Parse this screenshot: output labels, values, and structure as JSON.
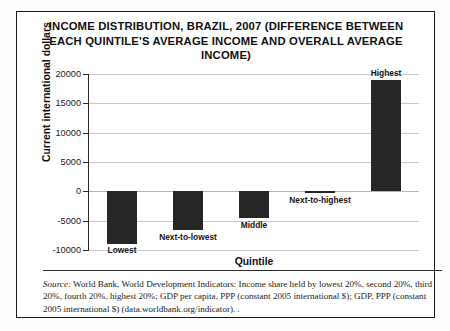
{
  "figure": {
    "title": "INCOME DISTRIBUTION, BRAZIL, 2007 (DIFFERENCE BETWEEN EACH QUINTILE'S AVERAGE INCOME AND OVERALL AVERAGE INCOME)",
    "source_prefix": "Source:",
    "source_text": " World Bank, World Development Indicators: Income share held by lowest 20%, second 20%, third 20%, fourth 20%, highest 20%; GDP per capita, PPP (constant 2005 international $); GDP, PPP (constant 2005 international $) (data.worldbank.org/indicator). ."
  },
  "colors": {
    "bar": "#262626",
    "grid": "#c9c9c9",
    "axis": "#2a2a2a",
    "text": "#111111",
    "background": "#ffffff"
  },
  "chart_data": {
    "type": "bar",
    "title": "INCOME DISTRIBUTION, BRAZIL, 2007 (DIFFERENCE BETWEEN EACH QUINTILE'S AVERAGE INCOME AND OVERALL AVERAGE INCOME)",
    "xlabel": "Quintile",
    "ylabel": "Current international dollars",
    "categories": [
      "Lowest",
      "Next-to-lowest",
      "Middle",
      "Next-to-highest",
      "Highest"
    ],
    "values": [
      -8900,
      -6600,
      -4600,
      -200,
      18900
    ],
    "ylim": [
      -10000,
      20000
    ],
    "yticks": [
      20000,
      15000,
      10000,
      5000,
      0,
      -5000,
      -10000
    ],
    "ytick_labels": [
      "20000",
      "15000",
      "10000",
      "5000",
      "0",
      "-5000",
      "-10000"
    ],
    "grid": true,
    "legend": false,
    "bar_color": "#262626"
  }
}
